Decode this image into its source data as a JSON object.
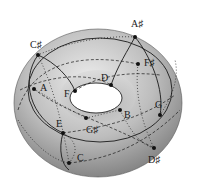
{
  "diagram": {
    "type": "tonnetz-torus",
    "colors": {
      "surface_light": "#e6e6e6",
      "surface_mid": "#b8b8b8",
      "surface_dark": "#7a7a7a",
      "line": "#1a1a1a",
      "hole": "#ffffff"
    },
    "nodes": [
      {
        "id": "A#",
        "label": "A♯",
        "x": 135,
        "y": 37,
        "lx": 131,
        "ly": 27
      },
      {
        "id": "C#",
        "label": "C♯",
        "x": 38,
        "y": 55,
        "lx": 30,
        "ly": 48
      },
      {
        "id": "F#",
        "label": "F♯",
        "x": 138,
        "y": 64,
        "lx": 144,
        "ly": 66
      },
      {
        "id": "A",
        "label": "A",
        "x": 34,
        "y": 89,
        "lx": 40,
        "ly": 91
      },
      {
        "id": "F",
        "label": "F",
        "x": 75,
        "y": 91,
        "lx": 64,
        "ly": 97
      },
      {
        "id": "D",
        "label": "D",
        "x": 111,
        "y": 85,
        "lx": 101,
        "ly": 81
      },
      {
        "id": "G",
        "label": "G",
        "x": 160,
        "y": 115,
        "lx": 155,
        "ly": 108
      },
      {
        "id": "B",
        "label": "B",
        "x": 120,
        "y": 110,
        "lx": 124,
        "ly": 118
      },
      {
        "id": "E",
        "label": "E",
        "x": 63,
        "y": 133,
        "lx": 56,
        "ly": 127
      },
      {
        "id": "G#",
        "label": "G♯",
        "x": 86,
        "y": 118,
        "lx": 86,
        "ly": 133
      },
      {
        "id": "C",
        "label": "C",
        "x": 69,
        "y": 163,
        "lx": 77,
        "ly": 161
      },
      {
        "id": "D#",
        "label": "D♯",
        "x": 154,
        "y": 148,
        "lx": 148,
        "ly": 163
      }
    ]
  }
}
